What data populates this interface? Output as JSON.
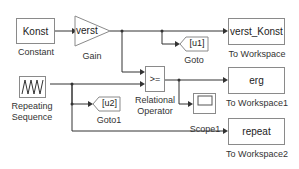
{
  "blocks": {
    "constant": {
      "value": "Konst",
      "label": "Constant"
    },
    "gain": {
      "value": "verst",
      "label": "Gain"
    },
    "goto": {
      "tag": "[u1]",
      "label": "Goto"
    },
    "goto1": {
      "tag": "[u2]",
      "label": "Goto1"
    },
    "to_workspace": {
      "value": "verst_Konst",
      "label": "To Workspace"
    },
    "to_workspace1": {
      "value": "erg",
      "label": "To Workspace1"
    },
    "to_workspace2": {
      "value": "repeat",
      "label": "To Workspace2"
    },
    "relational_operator": {
      "value": ">=",
      "label_line1": "Relational",
      "label_line2": "Operator"
    },
    "repeating_sequence": {
      "label_line1": "Repeating",
      "label_line2": "Sequence"
    },
    "scope1": {
      "label": "Scope1"
    }
  },
  "colors": {
    "block_border": "#8a8a8a",
    "wire": "#333333",
    "text": "#222222"
  }
}
